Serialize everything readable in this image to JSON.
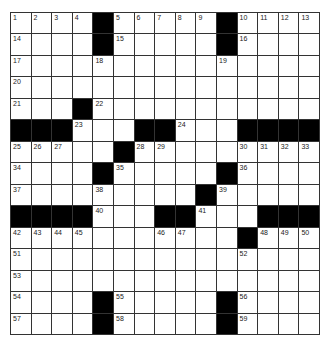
{
  "puzzle": {
    "rows": 15,
    "cols": 15,
    "colors": {
      "black": "#000000",
      "white": "#ffffff",
      "line": "#333333"
    },
    "grid": [
      "....#.....#....",
      "....#.....#....",
      "...............",
      "...............",
      "...#...........",
      "###...##...####",
      ".....#.........",
      "....#.....#....",
      ".........#.....",
      "####...##...###",
      "...........#...",
      "...............",
      "...............",
      "....#.....#....",
      "....#.....#...."
    ],
    "numbers": [
      [
        1,
        2,
        3,
        4,
        null,
        5,
        6,
        7,
        8,
        9,
        null,
        10,
        11,
        12,
        13
      ],
      [
        14,
        null,
        null,
        null,
        null,
        15,
        null,
        null,
        null,
        null,
        null,
        16,
        null,
        null,
        null
      ],
      [
        17,
        null,
        null,
        null,
        18,
        null,
        null,
        null,
        null,
        null,
        19,
        null,
        null,
        null,
        null
      ],
      [
        20,
        null,
        null,
        null,
        null,
        null,
        null,
        null,
        null,
        null,
        null,
        null,
        null,
        null,
        null
      ],
      [
        21,
        null,
        null,
        null,
        22,
        null,
        null,
        null,
        null,
        null,
        null,
        null,
        null,
        null,
        null
      ],
      [
        null,
        null,
        null,
        23,
        null,
        null,
        null,
        null,
        24,
        null,
        null,
        null,
        null,
        null,
        null
      ],
      [
        25,
        26,
        27,
        null,
        null,
        null,
        28,
        29,
        null,
        null,
        null,
        30,
        31,
        32,
        33
      ],
      [
        34,
        null,
        null,
        null,
        null,
        35,
        null,
        null,
        null,
        null,
        null,
        36,
        null,
        null,
        null
      ],
      [
        37,
        null,
        null,
        null,
        38,
        null,
        null,
        null,
        null,
        null,
        39,
        null,
        null,
        null,
        null
      ],
      [
        null,
        null,
        null,
        null,
        40,
        null,
        null,
        null,
        null,
        41,
        null,
        null,
        null,
        null,
        null
      ],
      [
        42,
        43,
        44,
        45,
        null,
        null,
        null,
        46,
        47,
        null,
        null,
        null,
        48,
        49,
        50
      ],
      [
        51,
        null,
        null,
        null,
        null,
        null,
        null,
        null,
        null,
        null,
        null,
        52,
        null,
        null,
        null
      ],
      [
        53,
        null,
        null,
        null,
        null,
        null,
        null,
        null,
        null,
        null,
        null,
        null,
        null,
        null,
        null
      ],
      [
        54,
        null,
        null,
        null,
        null,
        55,
        null,
        null,
        null,
        null,
        null,
        56,
        null,
        null,
        null
      ],
      [
        57,
        null,
        null,
        null,
        null,
        58,
        null,
        null,
        null,
        null,
        null,
        59,
        null,
        null,
        null
      ]
    ]
  }
}
